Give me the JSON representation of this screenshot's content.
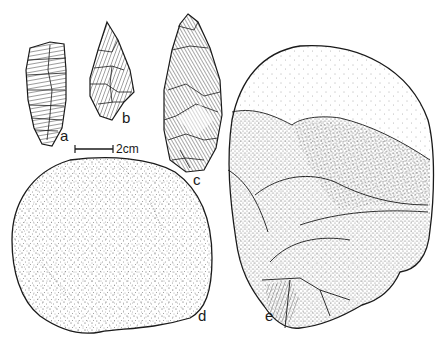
{
  "figure": {
    "type": "archaeological-illustration",
    "ink_color": "#1a1a1a",
    "background": "#ffffff"
  },
  "scale_bar": {
    "label": "2cm"
  },
  "artifacts": [
    {
      "id": "a",
      "label": "a",
      "shape": "flake-blade",
      "rendering": "hatched"
    },
    {
      "id": "b",
      "label": "b",
      "shape": "point",
      "rendering": "hatched"
    },
    {
      "id": "c",
      "label": "c",
      "shape": "leaf-point",
      "rendering": "hatched"
    },
    {
      "id": "d",
      "label": "d",
      "shape": "rounded-cobble",
      "rendering": "stippled"
    },
    {
      "id": "e",
      "label": "e",
      "shape": "core-cobble",
      "rendering": "stippled-facets"
    }
  ]
}
